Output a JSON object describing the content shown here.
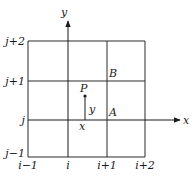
{
  "diagram": {
    "axes": {
      "x_label": "x",
      "y_label": "y"
    },
    "column_labels": [
      "i−1",
      "i",
      "i+1",
      "i+2"
    ],
    "row_labels": [
      "j−1",
      "j",
      "j+1",
      "j+2"
    ],
    "points": {
      "P": "P",
      "A": "A",
      "B": "B"
    },
    "offset_labels": {
      "x": "x",
      "y": "y"
    }
  }
}
